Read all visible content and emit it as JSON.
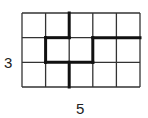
{
  "diagram": {
    "type": "grid-partition",
    "columns": 5,
    "rows": 3,
    "labels": {
      "height": "3",
      "width": "5"
    },
    "thick_path_segments": [
      [
        2,
        0,
        2,
        1
      ],
      [
        1,
        1,
        2,
        1
      ],
      [
        1,
        1,
        1,
        2
      ],
      [
        1,
        2,
        3,
        2
      ],
      [
        2,
        2,
        2,
        3
      ],
      [
        3,
        1,
        3,
        2
      ],
      [
        3,
        1,
        5,
        1
      ]
    ]
  }
}
